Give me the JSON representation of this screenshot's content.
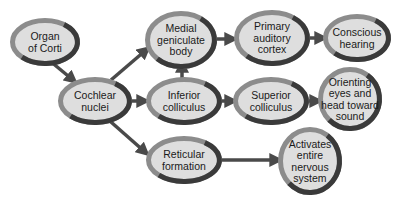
{
  "diagram": {
    "colors": {
      "fill": "#dedede",
      "ring_light": "#8c8c8c",
      "ring_dark": "#3a3a3a",
      "arrow": "#4a4a4a",
      "text": "#1a1a1a"
    },
    "nodes": [
      {
        "id": "organ-of-corti",
        "lines": [
          "Organ",
          "of Corti"
        ],
        "cx": 45,
        "cy": 42,
        "rx": 35,
        "ry": 24
      },
      {
        "id": "cochlear-nuclei",
        "lines": [
          "Cochlear",
          "nuclei"
        ],
        "cx": 95,
        "cy": 101,
        "rx": 37,
        "ry": 24
      },
      {
        "id": "medial-geniculate-body",
        "lines": [
          "Medial",
          "geniculate",
          "body"
        ],
        "cx": 181,
        "cy": 40,
        "rx": 36,
        "ry": 29
      },
      {
        "id": "primary-auditory-cortex",
        "lines": [
          "Primary",
          "auditory",
          "cortex"
        ],
        "cx": 272,
        "cy": 38,
        "rx": 38,
        "ry": 28
      },
      {
        "id": "conscious-hearing",
        "lines": [
          "Conscious",
          "hearing"
        ],
        "cx": 357,
        "cy": 38,
        "rx": 34,
        "ry": 24
      },
      {
        "id": "inferior-colliculus",
        "lines": [
          "Inferior",
          "colliculus"
        ],
        "cx": 184,
        "cy": 101,
        "rx": 38,
        "ry": 24
      },
      {
        "id": "superior-colliculus",
        "lines": [
          "Superior",
          "colliculus"
        ],
        "cx": 271,
        "cy": 101,
        "rx": 38,
        "ry": 24
      },
      {
        "id": "orienting-eyes-and-head-toward-sound",
        "lines": [
          "Orienting",
          "eyes and",
          "head toward",
          "sound"
        ],
        "cx": 350,
        "cy": 99,
        "rx": 32,
        "ry": 32
      },
      {
        "id": "reticular-formation",
        "lines": [
          "Reticular",
          "formation"
        ],
        "cx": 184,
        "cy": 160,
        "rx": 38,
        "ry": 24
      },
      {
        "id": "activates-entire-nervous-system",
        "lines": [
          "Activates",
          "entire",
          "nervous",
          "system"
        ],
        "cx": 310,
        "cy": 161,
        "rx": 32,
        "ry": 34
      }
    ],
    "edges": [
      {
        "from": "organ-of-corti",
        "to": "cochlear-nuclei",
        "x1": 50,
        "y1": 61,
        "x2": 73,
        "y2": 80
      },
      {
        "from": "cochlear-nuclei",
        "to": "medial-geniculate-body",
        "x1": 111,
        "y1": 80,
        "x2": 146,
        "y2": 50
      },
      {
        "from": "cochlear-nuclei",
        "to": "inferior-colliculus",
        "x1": 132,
        "y1": 101,
        "x2": 144,
        "y2": 101
      },
      {
        "from": "cochlear-nuclei",
        "to": "reticular-formation",
        "x1": 111,
        "y1": 122,
        "x2": 145,
        "y2": 152
      },
      {
        "from": "inferior-colliculus",
        "to": "medial-geniculate-body",
        "x1": 182,
        "y1": 78,
        "x2": 182,
        "y2": 65
      },
      {
        "from": "medial-geniculate-body",
        "to": "primary-auditory-cortex",
        "x1": 217,
        "y1": 39,
        "x2": 232,
        "y2": 39
      },
      {
        "from": "primary-auditory-cortex",
        "to": "conscious-hearing",
        "x1": 310,
        "y1": 38,
        "x2": 322,
        "y2": 38
      },
      {
        "from": "inferior-colliculus",
        "to": "superior-colliculus",
        "x1": 222,
        "y1": 101,
        "x2": 232,
        "y2": 101
      },
      {
        "from": "superior-colliculus",
        "to": "orienting-eyes-and-head-toward-sound",
        "x1": 309,
        "y1": 101,
        "x2": 317,
        "y2": 101
      },
      {
        "from": "reticular-formation",
        "to": "activates-entire-nervous-system",
        "x1": 222,
        "y1": 160,
        "x2": 277,
        "y2": 160
      }
    ]
  }
}
